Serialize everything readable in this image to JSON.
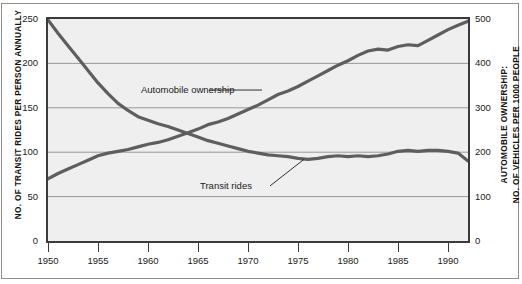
{
  "chart_data": {
    "type": "line",
    "title": "",
    "subtitle": "",
    "xlabel": "",
    "ylabel": "No. of Transit Rides per Person Annually",
    "y2label": "Automobile Ownership: No. of Vehicles per 1000 People",
    "grid": true,
    "legend_position": "inline-annotation",
    "xlim": [
      1950,
      1992
    ],
    "ylim": [
      0,
      250
    ],
    "y2lim": [
      0,
      500
    ],
    "xticks": [
      1950,
      1955,
      1960,
      1965,
      1970,
      1975,
      1980,
      1985,
      1990
    ],
    "xtick_labels": [
      "1950",
      "1955",
      "1960",
      "1965",
      "1970",
      "1975",
      "1980",
      "1985",
      "1990"
    ],
    "yticks": [
      0,
      50,
      100,
      150,
      200,
      250
    ],
    "ytick_labels": [
      "0",
      "50",
      "100",
      "150",
      "200",
      "250"
    ],
    "y2ticks": [
      0,
      100,
      200,
      300,
      400,
      500
    ],
    "y2tick_labels": [
      "0",
      "100",
      "200",
      "300",
      "400",
      "500"
    ],
    "series": [
      {
        "name": "Transit rides",
        "axis": "left",
        "units": "rides per person annually",
        "color": "#5e5e5e",
        "x": [
          1950,
          1951,
          1952,
          1953,
          1954,
          1955,
          1956,
          1957,
          1958,
          1959,
          1960,
          1961,
          1962,
          1963,
          1964,
          1965,
          1966,
          1967,
          1968,
          1969,
          1970,
          1971,
          1972,
          1973,
          1974,
          1975,
          1976,
          1977,
          1978,
          1979,
          1980,
          1981,
          1982,
          1983,
          1984,
          1985,
          1986,
          1987,
          1988,
          1989,
          1990,
          1991,
          1992
        ],
        "values": [
          249,
          234,
          220,
          206,
          192,
          178,
          166,
          155,
          147,
          140,
          136,
          132,
          129,
          125,
          121,
          117,
          113,
          110,
          107,
          104,
          101,
          99,
          97,
          96,
          95,
          93,
          92,
          93,
          95,
          96,
          95,
          96,
          95,
          96,
          98,
          101,
          102,
          101,
          102,
          102,
          101,
          99,
          90
        ]
      },
      {
        "name": "Automobile ownership",
        "axis": "right",
        "units": "vehicles per 1000 people",
        "color": "#5e5e5e",
        "x": [
          1950,
          1951,
          1952,
          1953,
          1954,
          1955,
          1956,
          1957,
          1958,
          1959,
          1960,
          1961,
          1962,
          1963,
          1964,
          1965,
          1966,
          1967,
          1968,
          1969,
          1970,
          1971,
          1972,
          1973,
          1974,
          1975,
          1976,
          1977,
          1978,
          1979,
          1980,
          1981,
          1982,
          1983,
          1984,
          1985,
          1986,
          1987,
          1988,
          1989,
          1990,
          1991,
          1992
        ],
        "values": [
          140,
          152,
          162,
          172,
          182,
          192,
          198,
          202,
          206,
          212,
          218,
          222,
          228,
          236,
          244,
          252,
          262,
          268,
          276,
          286,
          296,
          306,
          318,
          330,
          338,
          348,
          360,
          372,
          384,
          396,
          406,
          418,
          428,
          432,
          430,
          438,
          442,
          440,
          452,
          464,
          476,
          486,
          495
        ]
      }
    ],
    "annotations": [
      {
        "text": "Automobile ownership",
        "x": 1961,
        "y": 170,
        "axis": "left",
        "leader": true
      },
      {
        "text": "Transit rides",
        "x": 1968,
        "y": 60,
        "axis": "left",
        "leader": true
      }
    ]
  },
  "axes": {
    "left_title": "No. of Transit Rides per Person Annually",
    "right_title_line1": "Automobile Ownership:",
    "right_title_line2": "No. of Vehicles per 1000 People"
  }
}
